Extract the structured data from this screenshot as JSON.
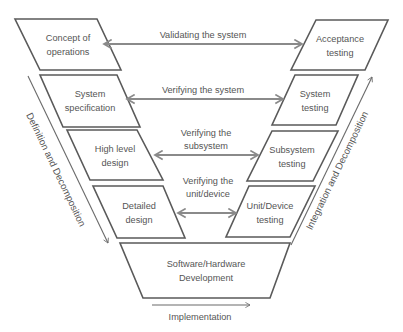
{
  "left_boxes": [
    {
      "line1": "Concept of",
      "line2": "operations"
    },
    {
      "line1": "System",
      "line2": "specification"
    },
    {
      "line1": "High level",
      "line2": "design"
    },
    {
      "line1": "Detailed",
      "line2": "design"
    }
  ],
  "right_boxes": [
    {
      "line1": "Acceptance",
      "line2": "testing"
    },
    {
      "line1": "System",
      "line2": "testing"
    },
    {
      "line1": "Subsystem",
      "line2": "testing"
    },
    {
      "line1": "Unit/Device",
      "line2": "testing"
    }
  ],
  "bottom_box": {
    "line1": "Software/Hardware",
    "line2": "Development"
  },
  "arrows": [
    {
      "line1": "Validating the system",
      "line2": ""
    },
    {
      "line1": "Verifying the system",
      "line2": ""
    },
    {
      "line1": "Verifying the",
      "line2": "subsystem"
    },
    {
      "line1": "Verifying the",
      "line2": "unit/device"
    }
  ],
  "side_labels": {
    "left": "Definition and Decomposition",
    "right": "Integration and Decomposition",
    "bottom": "Implementation"
  },
  "colors": {
    "stroke": "#5a5a5a",
    "arrow": "#8a8a8a",
    "text": "#555555"
  }
}
